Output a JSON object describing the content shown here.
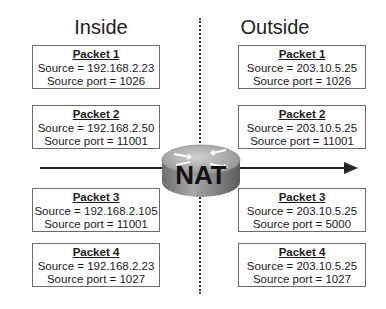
{
  "diagram": {
    "left_heading": "Inside",
    "right_heading": "Outside",
    "device_label": "NAT",
    "inside_packets": [
      {
        "title": "Packet 1",
        "source": "Source = 192.168.2.23",
        "port": "Source port = 1026"
      },
      {
        "title": "Packet 2",
        "source": "Source = 192.168.2.50",
        "port": "Source port = 11001"
      },
      {
        "title": "Packet 3",
        "source": "Source = 192.168.2.105",
        "port": "Source port = 11001"
      },
      {
        "title": "Packet 4",
        "source": "Source = 192.168.2.23",
        "port": "Source port = 1027"
      }
    ],
    "outside_packets": [
      {
        "title": "Packet 1",
        "source": "Source = 203.10.5.25",
        "port": "Source port = 1026"
      },
      {
        "title": "Packet 2",
        "source": "Source = 203.10.5.25",
        "port": "Source port = 11001"
      },
      {
        "title": "Packet 3",
        "source": "Source = 203.10.5.25",
        "port": "Source port = 5000"
      },
      {
        "title": "Packet 4",
        "source": "Source = 203.10.5.25",
        "port": "Source port = 1027"
      }
    ],
    "colors": {
      "router_body": "#8a8a8a",
      "router_top": "#b5b5b5",
      "line": "#222222"
    }
  }
}
